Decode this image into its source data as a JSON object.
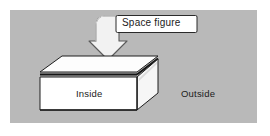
{
  "figure": {
    "name": "space-figure-diagram",
    "panel": {
      "background_color": "#b9b9b9",
      "outer_background_color": "#ffffff"
    },
    "callout": {
      "label": "Space figure",
      "box_fill": "#ffffff",
      "box_stroke": "#2a2a2a",
      "arrow_name": "curved-down-arrow",
      "arrow_fill": "#f2f2f2",
      "arrow_stroke": "#555555"
    },
    "solid": {
      "name": "rectangular-prism",
      "top_face_fill": "#fdfdfd",
      "front_face_fill": "#ffffff",
      "side_face_fill": "#f6f6f6",
      "stroke": "#1e1e1e",
      "seam_color": "#141414"
    },
    "labels": {
      "inside": "Inside",
      "outside": "Outside"
    }
  }
}
